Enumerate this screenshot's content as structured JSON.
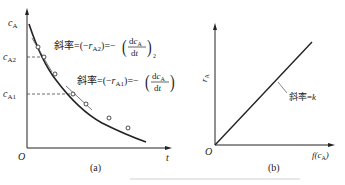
{
  "figure_a": {
    "panel_label": "(a)",
    "y_axis_label": "cA",
    "x_axis_label": "t",
    "origin_label": "O",
    "y_ticks": [
      "cA2",
      "cA1"
    ],
    "annotation_2": "斜率=(−rA2)=−(dcA/dt)2",
    "annotation_2_prefix": "斜率=(−r",
    "annotation_2_sub": "A2",
    "annotation_2_mid": ")=−",
    "annotation_2_frac_num": "dc",
    "annotation_2_frac_num_sub": "A",
    "annotation_2_frac_den": "dt",
    "annotation_2_outer_sub": "2",
    "annotation_1": "斜率=(−rA1)=−(dcA/dt)1",
    "annotation_1_prefix": "斜率=(−r",
    "annotation_1_sub": "A1",
    "annotation_1_mid": ")=−",
    "annotation_1_frac_num": "dc",
    "annotation_1_frac_num_sub": "A",
    "annotation_1_frac_den": "dt",
    "annotation_1_outer_sub": "1"
  },
  "figure_b": {
    "panel_label": "(b)",
    "y_axis_label": "rA",
    "x_axis_label": "f(cA)",
    "origin_label": "O",
    "slope_annotation": "斜率=k"
  },
  "colors": {
    "line": "#222222",
    "dashed": "#444444",
    "background": "#ffffff"
  }
}
